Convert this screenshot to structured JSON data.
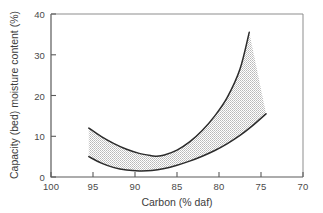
{
  "chart_data": {
    "type": "area",
    "title": "",
    "subtitle": "",
    "xlabel": "Carbon (% daf)",
    "ylabel": "Capacity (bed) moisture content (%)",
    "xlim": [
      100,
      70
    ],
    "ylim": [
      0,
      40
    ],
    "x_reversed": true,
    "grid": false,
    "legend": "none",
    "xticks": [
      100,
      95,
      90,
      85,
      80,
      75,
      70
    ],
    "yticks": [
      0,
      10,
      20,
      30,
      40
    ],
    "xtick_labels": [
      "100",
      "95",
      "90",
      "85",
      "80",
      "75",
      "70"
    ],
    "ytick_labels": [
      "0",
      "10",
      "20",
      "30",
      "40"
    ],
    "band_fill_color": "#d9d9d9",
    "curve_color": "#2b2b2b",
    "axis_color": "#5a5a5a",
    "annotations": [],
    "series": [
      {
        "name": "Upper bound",
        "x": [
          95.5,
          94.0,
          92.5,
          91.0,
          89.5,
          88.0,
          87.5,
          86.5,
          85.0,
          83.5,
          82.0,
          80.5,
          79.0,
          77.5,
          76.4
        ],
        "values": [
          12.0,
          9.9,
          8.2,
          6.8,
          5.8,
          5.2,
          5.1,
          5.4,
          6.6,
          8.6,
          11.4,
          15.0,
          19.6,
          26.5,
          35.5
        ]
      },
      {
        "name": "Lower bound",
        "x": [
          95.5,
          94.0,
          92.5,
          91.0,
          89.5,
          88.0,
          86.5,
          85.0,
          83.5,
          82.0,
          80.5,
          79.0,
          77.5,
          76.0,
          74.4
        ],
        "values": [
          5.0,
          3.4,
          2.3,
          1.7,
          1.5,
          1.6,
          2.1,
          2.9,
          3.9,
          5.1,
          6.5,
          8.2,
          10.2,
          12.6,
          15.5
        ]
      }
    ]
  }
}
